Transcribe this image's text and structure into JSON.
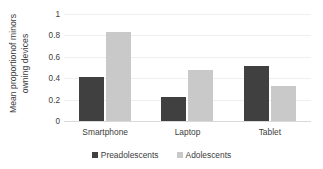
{
  "chart_data": {
    "type": "bar",
    "title": "",
    "xlabel": "",
    "ylabel_lines": [
      "Mean proportionof minors",
      "owning devices"
    ],
    "ylabel": "Mean proportionof minors owning devices",
    "categories": [
      "Smartphone",
      "Laptop",
      "Tablet"
    ],
    "series": [
      {
        "name": "Preadolescents",
        "color": "#404040",
        "values": [
          0.41,
          0.22,
          0.51
        ]
      },
      {
        "name": "Adolescents",
        "color": "#c9c9c9",
        "values": [
          0.83,
          0.48,
          0.33
        ]
      }
    ],
    "ylim": [
      0,
      1
    ],
    "yticks": [
      0,
      0.2,
      0.4,
      0.6,
      0.8,
      1
    ],
    "ytick_labels": [
      "0",
      "0.2",
      "0.4",
      "0.6",
      "0.8",
      "1"
    ],
    "grid": true,
    "grid_orientation": "horizontal",
    "legend_position": "bottom"
  }
}
